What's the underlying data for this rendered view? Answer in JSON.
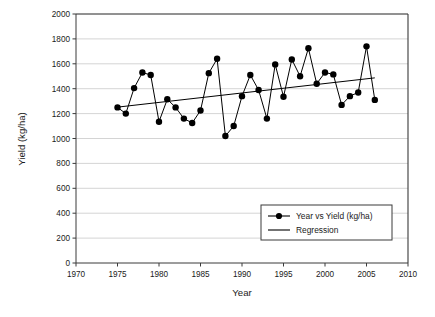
{
  "chart_data": {
    "type": "line",
    "title": "",
    "xlabel": "Year",
    "ylabel": "Yield (kg/ha)",
    "xlim": [
      1970,
      2010
    ],
    "ylim": [
      0,
      2000
    ],
    "xticks": [
      1970,
      1975,
      1980,
      1985,
      1990,
      1995,
      2000,
      2005,
      2010
    ],
    "yticks": [
      0,
      200,
      400,
      600,
      800,
      1000,
      1200,
      1400,
      1600,
      1800,
      2000
    ],
    "grid": "horizontal",
    "legend_position": "lower right",
    "series": [
      {
        "name": "Year vs Yield (kg/ha)",
        "marker": "filled-circle",
        "color": "#000000",
        "x": [
          1975,
          1976,
          1977,
          1978,
          1979,
          1980,
          1981,
          1982,
          1983,
          1984,
          1985,
          1986,
          1987,
          1988,
          1989,
          1990,
          1991,
          1992,
          1993,
          1994,
          1995,
          1996,
          1997,
          1998,
          1999,
          2000,
          2001,
          2002,
          2003,
          2004,
          2005,
          2006
        ],
        "values": [
          1250,
          1200,
          1405,
          1530,
          1510,
          1135,
          1315,
          1250,
          1160,
          1125,
          1225,
          1525,
          1640,
          1020,
          1100,
          1340,
          1510,
          1390,
          1160,
          1595,
          1335,
          1635,
          1500,
          1725,
          1440,
          1530,
          1515,
          1270,
          1340,
          1370,
          1740,
          1310
        ]
      },
      {
        "name": "Regression",
        "marker": "none",
        "color": "#000000",
        "x": [
          1975,
          2006
        ],
        "values": [
          1252,
          1487
        ]
      }
    ]
  },
  "legend": {
    "entries": [
      {
        "label": "Year vs Yield (kg/ha)",
        "marker": "line-with-circle"
      },
      {
        "label": "Regression",
        "marker": "line"
      }
    ]
  },
  "axes": {
    "x_title": "Year",
    "y_title": "Yield (kg/ha)",
    "x_tick_labels": [
      "1970",
      "1975",
      "1980",
      "1985",
      "1990",
      "1995",
      "2000",
      "2005",
      "2010"
    ],
    "y_tick_labels": [
      "0",
      "200",
      "400",
      "600",
      "800",
      "1000",
      "1200",
      "1400",
      "1600",
      "1800",
      "2000"
    ]
  },
  "style": {
    "axis_color": "#3a3a3a",
    "grid_color": "#c9c9c9",
    "series_color": "#000000",
    "background": "#ffffff"
  }
}
